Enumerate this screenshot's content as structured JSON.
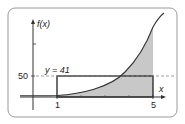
{
  "diagram": {
    "y_axis_label": "f(x)",
    "x_axis_label": "x",
    "y_tick_label": "50",
    "mean_value_label": "y = 41",
    "x_tick_labels": [
      "1",
      "5"
    ],
    "interval": [
      1,
      5
    ],
    "mean_value": 41,
    "colors": {
      "shade": "#c8c8c8",
      "curve": "#333333",
      "rectangle": "#222222",
      "dashed": "#888888",
      "frame": "#999999"
    }
  }
}
